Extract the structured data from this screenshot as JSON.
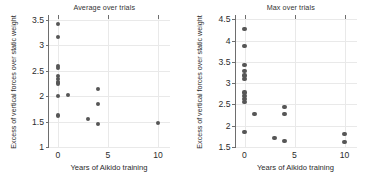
{
  "figure": {
    "width": 373,
    "height": 184,
    "background": "#ffffff",
    "marker_color": "#565656",
    "axis_color": "#6e6e6e",
    "grid_color": "#e9e9e9"
  },
  "chart_data": [
    {
      "type": "scatter",
      "title": "Average over trials",
      "xlabel": "Years of Aikido training",
      "ylabel": "Excess of vertical forces over static weight",
      "xlim": [
        -0.9,
        11.2
      ],
      "ylim": [
        1.0,
        3.6
      ],
      "xticks": [
        0,
        5,
        10
      ],
      "xticklabels": [
        "0",
        "5",
        "10"
      ],
      "yticks": [
        1,
        1.5,
        2,
        2.5,
        3,
        3.5
      ],
      "yticklabels": [
        "1",
        "1.5",
        "2",
        "2.5",
        "3",
        "3.5"
      ],
      "grid": true,
      "legend": null,
      "x": [
        0,
        0,
        0,
        0,
        0,
        0,
        0,
        0,
        0,
        0,
        1,
        3,
        4,
        4,
        4,
        10
      ],
      "y": [
        3.42,
        3.16,
        2.6,
        2.56,
        2.4,
        2.34,
        2.28,
        2.25,
        2.01,
        1.62,
        2.02,
        1.55,
        2.15,
        1.84,
        1.46,
        1.48
      ]
    },
    {
      "type": "scatter",
      "title": "Max over trials",
      "xlabel": "Years of Aikido training",
      "ylabel": "Excess of vertical forces over static weight",
      "xlim": [
        -0.9,
        11.2
      ],
      "ylim": [
        1.5,
        4.6
      ],
      "xticks": [
        0,
        5,
        10
      ],
      "xticklabels": [
        "0",
        "5",
        "10"
      ],
      "yticks": [
        1.5,
        2,
        2.5,
        3,
        3.5,
        4,
        4.5
      ],
      "yticklabels": [
        "1.5",
        "2",
        "2.5",
        "3",
        "3.5",
        "4",
        "4.5"
      ],
      "grid": true,
      "legend": null,
      "x": [
        0,
        0,
        0,
        0,
        0,
        0,
        0,
        0,
        0,
        0,
        0,
        1,
        3,
        4,
        4,
        4,
        10,
        10
      ],
      "y": [
        4.28,
        3.87,
        3.42,
        3.28,
        3.18,
        3.1,
        2.78,
        2.7,
        2.62,
        2.55,
        1.86,
        2.27,
        1.71,
        2.43,
        2.28,
        1.64,
        1.8,
        1.62
      ]
    }
  ]
}
